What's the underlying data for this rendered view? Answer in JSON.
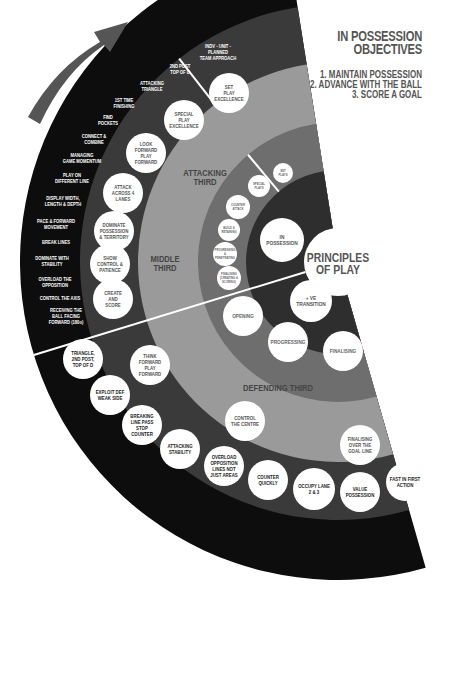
{
  "objectives": {
    "title_line1": "IN POSSESSION",
    "title_line2": "OBJECTIVES",
    "items": [
      "1. MAINTAIN POSSESSION",
      "2. ADVANCE WITH THE BALL",
      "3. SCORE A GOAL"
    ]
  },
  "center": {
    "line1": "PRINCIPLES",
    "line2": "OF PLAY"
  },
  "colors": {
    "ring_outer": "#0d0d0d",
    "ring_2": "#3a3a3a",
    "ring_3": "#9a9a9a",
    "ring_4": "#6e6e6e",
    "ring_5": "#2e2e2e",
    "circle": "#ffffff",
    "arrow": "#555555",
    "zone_label": "#444444"
  },
  "zones": {
    "attacking_third": [
      "ATTACKING",
      "THIRD"
    ],
    "middle_third": [
      "MIDDLE",
      "THIRD"
    ],
    "defending_third": [
      "DEFENDING THIRD"
    ]
  },
  "outer_ring_text": [
    [
      "INDV - UNIT -",
      "PLANNED",
      "TEAM APPROACH"
    ],
    [
      "2ND POST",
      "TOP OF D"
    ],
    [
      "ATTACKING",
      "TRIANGLE"
    ],
    [
      "1ST TIME",
      "FINISHING"
    ],
    [
      "FIND",
      "POCKETS"
    ],
    [
      "CONNECT &",
      "COMBINE"
    ],
    [
      "MANAGING",
      "GAME MOMENTUM"
    ],
    [
      "PLAY ON",
      "DIFFERENT LINE"
    ],
    [
      "DISPLAY WIDTH,",
      "LENGTH & DEPTH"
    ],
    [
      "PACE & FORWARD",
      "MOVEMENT"
    ],
    [
      "BREAK LINES"
    ],
    [
      "DOMINATE WITH",
      "STABILITY"
    ],
    [
      "OVERLOAD THE",
      "OPPOSITION"
    ],
    [
      "CONTROL THE AXIS"
    ],
    [
      "RECEIVING THE",
      "BALL FACING",
      "FORWARD (180o)"
    ]
  ],
  "outer_ring_circles": [
    [
      "TRIANGLE,",
      "2ND POST,",
      "TOP OF D"
    ],
    [
      "EXPLOIT DEF",
      "WEAK SIDE"
    ],
    [
      "BREAKING",
      "LINE PASS",
      "STOP",
      "COUNTER"
    ],
    [
      "ATTACKING",
      "STABILITY"
    ],
    [
      "OVERLOAD",
      "OPPOSITION",
      "LINES NOT",
      "JUST AREAS"
    ],
    [
      "COUNTER",
      "QUICKLY"
    ],
    [
      "OCCUPY LANE",
      "2 & 3"
    ],
    [
      "VALUE",
      "POSSESSION"
    ],
    [
      "FAST IN FIRST",
      "ACTION"
    ]
  ],
  "ring2_circles": [
    [
      "SET",
      "PLAY",
      "EXCELLENCE"
    ],
    [
      "SPECIAL",
      "PLAY",
      "EXCELLENCE"
    ],
    [
      "LOOK",
      "FORWARD",
      "PLAY",
      "FORWARD"
    ],
    [
      "ATTACK",
      "ACROSS 4",
      "LANES"
    ],
    [
      "DOMINATE",
      "POSSESSION",
      "& TERRITORY"
    ],
    [
      "SHOW",
      "CONTROL &",
      "PATIENCE"
    ],
    [
      "CREATE",
      "AND",
      "SCORE"
    ],
    [
      "THINK",
      "FORWARD",
      "PLAY",
      "FORWARD"
    ],
    [
      "CONTROL",
      "THE CENTRE"
    ],
    [
      "FINALISING",
      "OVER THE",
      "GOAL LINE"
    ]
  ],
  "ring4_circles": [
    [
      "SET",
      "PLAYS"
    ],
    [
      "SPECIAL",
      "PLAYS"
    ],
    [
      "COUNTER",
      "ATTACK"
    ],
    [
      "BUILD &",
      "RETAINING"
    ],
    [
      "PROGRESSING",
      "&",
      "PENETRATING"
    ],
    [
      "FINALISING",
      "(CREATING &",
      "SCORING)"
    ],
    [
      "OPENING"
    ],
    [
      "PROGRESSING"
    ],
    [
      "FINALISING"
    ]
  ],
  "ring5_circles": [
    [
      "IN",
      "POSSESSION"
    ],
    [
      "+ VE",
      "TRANSITION"
    ]
  ]
}
